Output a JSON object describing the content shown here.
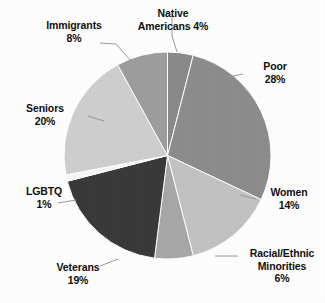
{
  "chart_data": {
    "type": "pie",
    "title": "",
    "subtitle": "",
    "xlabel": "",
    "ylabel": "",
    "legend_position": "none",
    "labels_position": "outside-with-leader-lines",
    "grid": false,
    "start_angle_deg": 0,
    "direction": "clockwise",
    "unit": "%",
    "categories": [
      "Native Americans",
      "Poor",
      "Women",
      "Racial/Ethnic Minorities",
      "Veterans",
      "LGBTQ",
      "Seniors",
      "Immigrants"
    ],
    "values": [
      4,
      28,
      14,
      6,
      19,
      1,
      20,
      8
    ],
    "total": 100,
    "colors": [
      "#8a8a8a",
      "#8d8d8d",
      "#c3c3c3",
      "#a8a8a8",
      "#3a3a3a",
      "#f7f7f7",
      "#cfcfcf",
      "#9e9e9e"
    ],
    "slices": [
      {
        "label": "Native Americans",
        "value": 4,
        "value_text": "4%",
        "color": "#8a8a8a"
      },
      {
        "label": "Poor",
        "value": 28,
        "value_text": "28%",
        "color": "#8d8d8d"
      },
      {
        "label": "Women",
        "value": 14,
        "value_text": "14%",
        "color": "#c3c3c3"
      },
      {
        "label": "Racial/Ethnic Minorities",
        "value": 6,
        "value_text": "6%",
        "color": "#a8a8a8"
      },
      {
        "label": "Veterans",
        "value": 19,
        "value_text": "19%",
        "color": "#3a3a3a"
      },
      {
        "label": "LGBTQ",
        "value": 1,
        "value_text": "1%",
        "color": "#f7f7f7"
      },
      {
        "label": "Seniors",
        "value": 20,
        "value_text": "20%",
        "color": "#cfcfcf"
      },
      {
        "label": "Immigrants",
        "value": 8,
        "value_text": "8%",
        "color": "#9e9e9e"
      }
    ]
  },
  "labels": {
    "native_americans": {
      "line1": "Native",
      "line2": "Americans 4%"
    },
    "immigrants": {
      "line1": "Immigrants",
      "line2": "8%"
    },
    "poor": {
      "line1": "Poor",
      "line2": "28%"
    },
    "seniors": {
      "line1": "Seniors",
      "line2": "20%"
    },
    "lgbtq": {
      "line1": "LGBTQ",
      "line2": "1%"
    },
    "veterans": {
      "line1": "Veterans",
      "line2": "19%"
    },
    "women": {
      "line1": "Women",
      "line2": "14%"
    },
    "racial_minorities": {
      "line1": "Racial/Ethnic",
      "line2": "Minorities",
      "line3": "6%"
    }
  },
  "style": {
    "background": "#ffffff",
    "text_color": "#101010",
    "leader_line_color": "#9a9a9a"
  }
}
